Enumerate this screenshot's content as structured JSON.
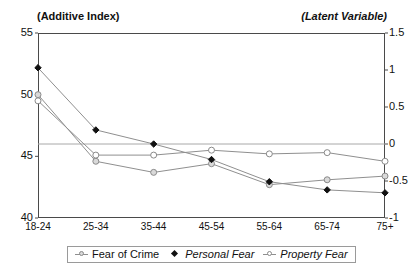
{
  "captions": {
    "left_axis": "(Additive Index)",
    "right_axis": "(Latent Variable)"
  },
  "axes": {
    "left_ticks": [
      "55",
      "50",
      "45",
      "40"
    ],
    "right_ticks": [
      "1.5",
      "1",
      "0.5",
      "0",
      "-0.5",
      "-1"
    ],
    "x_ticks": [
      "18-24",
      "25-34",
      "35-44",
      "45-54",
      "55-64",
      "65-74",
      "75+"
    ]
  },
  "legend": {
    "items": [
      {
        "label": "Fear of Crime",
        "marker": "circle-gray-icon",
        "italic": false
      },
      {
        "label": "Personal Fear",
        "marker": "diamond-filled-icon",
        "italic": true
      },
      {
        "label": "Property Fear",
        "marker": "circle-open-icon",
        "italic": true
      }
    ]
  },
  "colors": {
    "line": "#8f8f8f",
    "axis": "#4a4a4a",
    "gridline": "#a8a8a8",
    "marker_fill_gray": "#d9d9d9",
    "marker_stroke": "#8a8a8a",
    "marker_fill_dark": "#111111"
  },
  "chart_data": {
    "type": "line",
    "title": "",
    "xlabel": "",
    "ylabel": "(Additive Index)",
    "y2label": "(Latent Variable)",
    "categories": [
      "18-24",
      "25-34",
      "35-44",
      "45-54",
      "55-64",
      "65-74",
      "75+"
    ],
    "ylim": [
      40,
      55
    ],
    "y2lim": [
      -1,
      1.5
    ],
    "yticks": [
      40,
      45,
      50,
      55
    ],
    "y2ticks": [
      -1,
      -0.5,
      0,
      0.5,
      1,
      1.5
    ],
    "grid": true,
    "gridlines": [
      {
        "axis": "y2",
        "value": 0
      }
    ],
    "legend_position": "bottom",
    "series": [
      {
        "name": "Fear of Crime",
        "axis": "left",
        "marker": "circle-gray",
        "values": [
          50.0,
          44.6,
          43.7,
          44.4,
          42.7,
          43.1,
          43.4
        ]
      },
      {
        "name": "Personal Fear",
        "axis": "right",
        "marker": "diamond-filled",
        "values": [
          1.03,
          0.19,
          0.0,
          -0.21,
          -0.51,
          -0.62,
          -0.66
        ]
      },
      {
        "name": "Property Fear",
        "axis": "right",
        "marker": "circle-open",
        "values": [
          0.0,
          -0.1,
          -0.1,
          -0.05,
          -0.08,
          -0.07,
          -0.2
        ]
      }
    ],
    "property_fear_left_scale": [
      49.5,
      45.1,
      45.1,
      45.5,
      45.2,
      45.3,
      44.6
    ]
  }
}
